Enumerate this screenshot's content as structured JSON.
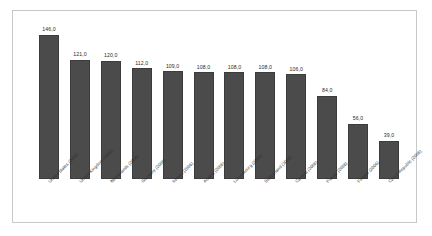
{
  "chart_data": {
    "type": "bar",
    "title": "",
    "subtitle": "",
    "xlabel": "",
    "ylabel": "",
    "ylim": [
      0,
      160
    ],
    "grid": false,
    "legend": null,
    "bar_color": "#4b4b4b",
    "decimal_separator": ",",
    "categories": [
      "United States (2006)",
      "United Kingdom (2006)",
      "Netherlands (2006)",
      "Germany (2006)",
      "Ireland (2006)",
      "Austria (2006)",
      "Luxembourg (2006)",
      "Switzerland (2006)",
      "Canada (2006)",
      "France (2006)",
      "Finland (2006)",
      "Czech Republic (2006)"
    ],
    "values": [
      146.0,
      121.0,
      120.0,
      112.0,
      109.0,
      108.0,
      108.0,
      108.0,
      106.0,
      84.0,
      56.0,
      39.0
    ],
    "value_labels": [
      "146,0",
      "121,0",
      "120,0",
      "112,0",
      "109,0",
      "108,0",
      "108,0",
      "108,0",
      "106,0",
      "84,0",
      "56,0",
      "39,0"
    ]
  },
  "frame": {
    "border_color": "#c8c8c8",
    "background": "#ffffff"
  }
}
